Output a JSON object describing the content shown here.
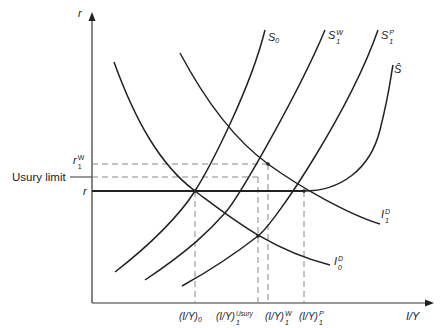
{
  "diagram": {
    "y_axis_label": "r",
    "x_axis_label": "I/Y",
    "left_labels": {
      "r1w_base": "r",
      "r1w_sup": "W",
      "r1w_sub": "1",
      "usury_limit": "Usury limit",
      "r": "r"
    },
    "curve_labels": {
      "S0_base": "S",
      "S0_sub": "0",
      "S1W_base": "S",
      "S1W_sup": "W",
      "S1W_sub": "1",
      "S1P_base": "S",
      "S1P_sup": "P",
      "S1P_sub": "1",
      "Shat": "Ŝ",
      "I1D_base": "I",
      "I1D_sup": "D",
      "I1D_sub": "1",
      "I0D_base": "I",
      "I0D_sup": "D",
      "I0D_sub": "0"
    },
    "x_tick_labels": {
      "t0_base": "(I/Y)",
      "t0_sub": "0",
      "t1_base": "(I/Y)",
      "t1_sup": "Usury",
      "t1_sub": "1",
      "t2_base": "(I/Y)",
      "t2_sup": "W",
      "t2_sub": "1",
      "t3_base": "(I/Y)",
      "t3_sup": "P",
      "t3_sub": "1"
    },
    "colors": {
      "curve": "#222222",
      "dashed": "#888888"
    }
  }
}
